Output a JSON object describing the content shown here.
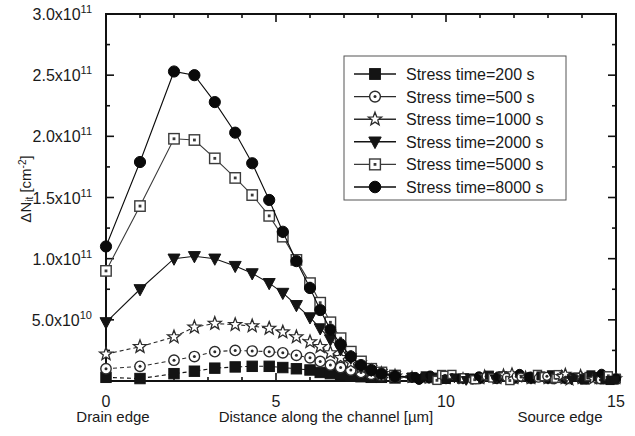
{
  "chart_data": {
    "type": "line",
    "title": "",
    "subtitle": "",
    "xlabel": "Distance along the channel [µm]",
    "ylabel": "ΔN_it [cm^-2]",
    "ylabel_main": "ΔN",
    "ylabel_sub": "it",
    "ylabel_unit_open": " [cm",
    "ylabel_unit_sup": "-2",
    "ylabel_unit_close": "]",
    "xlim": [
      0,
      15
    ],
    "ylim": [
      0,
      300000000000.0
    ],
    "grid": false,
    "legend_position": "upper-right-inside",
    "x_ticks": [
      0,
      5,
      10,
      15
    ],
    "x_tick_labels": [
      "0",
      "5",
      "10",
      "15"
    ],
    "x_minor_ticks": [
      1,
      2,
      3,
      4,
      6,
      7,
      8,
      9,
      11,
      12,
      13,
      14
    ],
    "y_ticks": [
      0,
      50000000000.0,
      100000000000.0,
      150000000000.0,
      200000000000.0,
      250000000000.0,
      300000000000.0
    ],
    "y_tick_labels": [
      "",
      "5.0x10",
      "1.0x10",
      "1.5x10",
      "2.0x10",
      "2.5x10",
      "3.0x10"
    ],
    "y_tick_exponents": [
      "",
      "10",
      "11",
      "11",
      "11",
      "11",
      "11"
    ],
    "y_minor_ticks": [
      25000000000.0,
      75000000000.0,
      125000000000.0,
      175000000000.0,
      225000000000.0,
      275000000000.0
    ],
    "edge_labels": {
      "left": "Drain edge",
      "right": "Source  edge"
    },
    "series": [
      {
        "name": "Stress time=200 s",
        "marker": "filled-square",
        "color": "#141414",
        "linestyle": "dashed",
        "x": [
          0,
          1,
          2,
          2.6,
          3.2,
          3.8,
          4.3,
          4.8,
          5.2,
          5.6,
          6.0,
          6.3,
          6.6,
          6.9,
          7.2,
          7.5,
          7.8,
          8.1,
          8.5,
          9.0,
          9.5,
          10.0,
          10.5,
          11.0,
          11.5,
          12.0,
          12.5,
          13.0,
          13.5,
          14.0,
          14.5,
          15.0
        ],
        "y": [
          3000000000.0,
          2000000000.0,
          6000000000.0,
          8000000000.0,
          10500000000.0,
          11500000000.0,
          12000000000.0,
          12000000000.0,
          11000000000.0,
          10000000000.0,
          9000000000.0,
          7000000000.0,
          6000000000.0,
          5000000000.0,
          4000000000.0,
          3500000000.0,
          3000000000.0,
          3000000000.0,
          2500000000.0,
          2500000000.0,
          2000000000.0,
          2000000000.0,
          2000000000.0,
          2000000000.0,
          2000000000.0,
          2000000000.0,
          2000000000.0,
          2000000000.0,
          2000000000.0,
          2000000000.0,
          2000000000.0,
          2000000000.0
        ]
      },
      {
        "name": "Stress time=500 s",
        "marker": "open-circle",
        "color": "#2b2b2b",
        "linestyle": "dashed",
        "x": [
          0,
          1,
          2,
          2.6,
          3.2,
          3.8,
          4.3,
          4.8,
          5.2,
          5.6,
          6.0,
          6.3,
          6.6,
          6.9,
          7.2,
          7.5,
          7.8,
          8.1,
          8.5,
          9.0,
          9.5,
          10.0,
          10.5,
          11.0,
          11.5,
          12.0,
          12.5,
          13.0,
          13.5,
          14.0,
          14.5,
          15.0
        ],
        "y": [
          10000000000.0,
          12000000000.0,
          17000000000.0,
          20000000000.0,
          24000000000.0,
          25000000000.0,
          24500000000.0,
          24000000000.0,
          23000000000.0,
          21000000000.0,
          19000000000.0,
          16000000000.0,
          13000000000.0,
          11000000000.0,
          9000000000.0,
          7000000000.0,
          5500000000.0,
          4500000000.0,
          3500000000.0,
          3000000000.0,
          2500000000.0,
          2500000000.0,
          2000000000.0,
          2000000000.0,
          2000000000.0,
          2000000000.0,
          2000000000.0,
          2000000000.0,
          2000000000.0,
          2000000000.0,
          2000000000.0,
          2000000000.0
        ]
      },
      {
        "name": "Stress time=1000 s",
        "marker": "open-star",
        "color": "#2b2b2b",
        "linestyle": "dashed",
        "x": [
          0,
          1,
          2,
          2.6,
          3.2,
          3.8,
          4.3,
          4.8,
          5.2,
          5.6,
          6.0,
          6.3,
          6.6,
          6.9,
          7.2,
          7.5,
          7.8,
          8.1,
          8.5,
          9.0,
          9.5,
          10.0,
          10.5,
          11.0,
          11.5,
          12.0,
          12.5,
          13.0,
          13.5,
          14.0,
          14.5,
          15.0
        ],
        "y": [
          22000000000.0,
          28000000000.0,
          36000000000.0,
          44000000000.0,
          47000000000.0,
          46000000000.0,
          45000000000.0,
          43000000000.0,
          40000000000.0,
          36000000000.0,
          32000000000.0,
          28000000000.0,
          23000000000.0,
          19000000000.0,
          15000000000.0,
          11000000000.0,
          8000000000.0,
          6000000000.0,
          4000000000.0,
          3000000000.0,
          2500000000.0,
          2000000000.0,
          2000000000.0,
          2000000000.0,
          2000000000.0,
          2000000000.0,
          2000000000.0,
          2000000000.0,
          2000000000.0,
          2000000000.0,
          2000000000.0,
          2000000000.0
        ]
      },
      {
        "name": "Stress time=2000 s",
        "marker": "filled-triangle-down",
        "color": "#141414",
        "linestyle": "solid",
        "x": [
          0,
          1,
          2,
          2.6,
          3.2,
          3.8,
          4.3,
          4.8,
          5.2,
          5.6,
          6.0,
          6.3,
          6.6,
          6.9,
          7.2,
          7.5,
          7.8,
          8.1,
          8.5,
          9.0,
          9.5,
          10.0,
          10.5,
          11.0,
          11.5,
          12.0,
          12.5,
          13.0,
          13.5,
          14.0,
          14.5,
          15.0
        ],
        "y": [
          48000000000.0,
          75000000000.0,
          100000000000.0,
          102000000000.0,
          100000000000.0,
          94000000000.0,
          88000000000.0,
          80000000000.0,
          72000000000.0,
          62000000000.0,
          52000000000.0,
          43000000000.0,
          34000000000.0,
          26000000000.0,
          19000000000.0,
          13000000000.0,
          9000000000.0,
          6000000000.0,
          4000000000.0,
          3000000000.0,
          2500000000.0,
          2000000000.0,
          2000000000.0,
          2000000000.0,
          2000000000.0,
          2000000000.0,
          2000000000.0,
          2000000000.0,
          2000000000.0,
          2000000000.0,
          2000000000.0,
          2000000000.0
        ]
      },
      {
        "name": "Stress time=5000 s",
        "marker": "open-square",
        "color": "#3a3a3a",
        "linestyle": "solid",
        "x": [
          0,
          1,
          2,
          2.6,
          3.2,
          3.8,
          4.3,
          4.8,
          5.2,
          5.6,
          6.0,
          6.3,
          6.6,
          6.9,
          7.2,
          7.5,
          7.8,
          8.1,
          8.5,
          9.0,
          9.5,
          10.0,
          10.5,
          11.0,
          11.5,
          12.0,
          12.5,
          13.0,
          13.5,
          14.0,
          14.5,
          15.0
        ],
        "y": [
          90000000000.0,
          143000000000.0,
          198000000000.0,
          197000000000.0,
          182000000000.0,
          166000000000.0,
          152000000000.0,
          135000000000.0,
          118000000000.0,
          99000000000.0,
          80000000000.0,
          64000000000.0,
          48000000000.0,
          35000000000.0,
          24000000000.0,
          16000000000.0,
          10000000000.0,
          7000000000.0,
          4500000000.0,
          3000000000.0,
          2500000000.0,
          2000000000.0,
          2000000000.0,
          2000000000.0,
          2000000000.0,
          2000000000.0,
          2000000000.0,
          2000000000.0,
          2000000000.0,
          2000000000.0,
          2000000000.0,
          2000000000.0
        ]
      },
      {
        "name": "Stress time=8000 s",
        "marker": "filled-circle",
        "color": "#0a0a0a",
        "linestyle": "solid",
        "x": [
          0,
          1,
          2,
          2.6,
          3.2,
          3.8,
          4.3,
          4.8,
          5.2,
          5.6,
          6.0,
          6.3,
          6.6,
          6.9,
          7.2,
          7.5,
          7.8,
          8.1,
          8.5,
          9.0,
          9.5,
          10.0,
          10.5,
          11.0,
          11.5,
          12.0,
          12.5,
          13.0,
          13.5,
          14.0,
          14.5,
          15.0
        ],
        "y": [
          110000000000.0,
          179000000000.0,
          253000000000.0,
          250000000000.0,
          228000000000.0,
          203000000000.0,
          178000000000.0,
          148000000000.0,
          122000000000.0,
          98000000000.0,
          76000000000.0,
          58000000000.0,
          42000000000.0,
          30000000000.0,
          20000000000.0,
          13000000000.0,
          9000000000.0,
          6000000000.0,
          4000000000.0,
          3000000000.0,
          2500000000.0,
          2000000000.0,
          2000000000.0,
          2000000000.0,
          2000000000.0,
          2000000000.0,
          2000000000.0,
          2000000000.0,
          2000000000.0,
          2000000000.0,
          2000000000.0,
          2000000000.0
        ]
      }
    ],
    "noise_band": {
      "description": "dense overlapping markers near zero from x=9 to x=15",
      "x_start": 9.0,
      "x_end": 15.0,
      "y_level": 2000000000.0
    }
  },
  "legend": {
    "items": [
      {
        "label": "Stress time=200 s",
        "marker": "filled-square"
      },
      {
        "label": "Stress time=500 s",
        "marker": "open-circle"
      },
      {
        "label": "Stress time=1000 s",
        "marker": "open-star"
      },
      {
        "label": "Stress time=2000 s",
        "marker": "filled-triangle-down"
      },
      {
        "label": "Stress time=5000 s",
        "marker": "open-square"
      },
      {
        "label": "Stress time=8000 s",
        "marker": "filled-circle"
      }
    ]
  }
}
